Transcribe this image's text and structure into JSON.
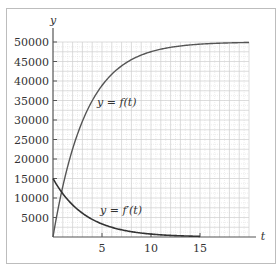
{
  "chart_data": {
    "type": "line",
    "title": "",
    "xlabel": "t",
    "ylabel": "y",
    "xlim": [
      0,
      20
    ],
    "ylim": [
      0,
      50000
    ],
    "x_ticks": [
      5,
      10,
      15
    ],
    "y_ticks": [
      5000,
      10000,
      15000,
      20000,
      25000,
      30000,
      35000,
      40000,
      45000,
      50000
    ],
    "grid": true,
    "minor_grid": {
      "x_step": 1,
      "y_step": 2500
    },
    "series": [
      {
        "name": "y = f(t)",
        "x": [
          0,
          1,
          2,
          3,
          4,
          5,
          6,
          7,
          8,
          9,
          10,
          11,
          12,
          13,
          14,
          15,
          16,
          17,
          18,
          19,
          20
        ],
        "values": [
          0,
          12959,
          22559,
          29672,
          34940,
          38843,
          41735,
          43877,
          45464,
          46640,
          47511,
          48156,
          48634,
          48988,
          49250,
          49445,
          49589,
          49695,
          49774,
          49833,
          49876
        ]
      },
      {
        "name": "y = f'(t)",
        "x": [
          0,
          1,
          2,
          3,
          4,
          5,
          6,
          7,
          8,
          9,
          10,
          11,
          12,
          13,
          14,
          15
        ],
        "values": [
          15000,
          11112,
          8232,
          6098,
          4518,
          3347,
          2479,
          1837,
          1361,
          1008,
          747,
          553,
          410,
          304,
          225,
          167
        ]
      }
    ],
    "annotations": [
      {
        "text": "y = f(t)",
        "x": 6.5,
        "y": 31000
      },
      {
        "text": "y = f'(t)",
        "x": 6.5,
        "y": 4000
      }
    ]
  },
  "labels": {
    "x_axis": "t",
    "y_axis": "y",
    "f_label": "y = f(t)",
    "fp_label": "y = f′(t)",
    "x_tick_labels": [
      "5",
      "10",
      "15"
    ],
    "y_tick_labels": [
      "5000",
      "10000",
      "15000",
      "20000",
      "25000",
      "30000",
      "35000",
      "40000",
      "45000",
      "50000"
    ]
  }
}
